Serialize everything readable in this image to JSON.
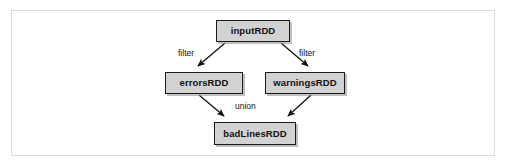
{
  "figure": {
    "frame_border_color": "#dcdcdc",
    "background_color": "#ffffff"
  },
  "diagram": {
    "type": "flow-graph",
    "node_fill_color": "#d2d2d2",
    "node_border_color": "#1a1a1a",
    "nodes": [
      {
        "id": "inputRDD",
        "label": "inputRDD",
        "x": 216,
        "y": 20,
        "w": 74,
        "h": 22
      },
      {
        "id": "errorsRDD",
        "label": "errorsRDD",
        "x": 165,
        "y": 72,
        "w": 78,
        "h": 22
      },
      {
        "id": "warningsRDD",
        "label": "warningsRDD",
        "x": 265,
        "y": 72,
        "w": 80,
        "h": 22
      },
      {
        "id": "badLinesRDD",
        "label": "badLinesRDD",
        "x": 214,
        "y": 122,
        "w": 82,
        "h": 23
      }
    ],
    "edges": [
      {
        "from": "inputRDD",
        "to": "errorsRDD",
        "label": "filter"
      },
      {
        "from": "inputRDD",
        "to": "warningsRDD",
        "label": "filter"
      },
      {
        "from": "errorsRDD",
        "to": "badLinesRDD",
        "label": "union"
      },
      {
        "from": "warningsRDD",
        "to": "badLinesRDD",
        "label": "union"
      }
    ],
    "edge_labels": {
      "filter_left": "filter",
      "filter_right": "filter",
      "union": "union"
    }
  }
}
